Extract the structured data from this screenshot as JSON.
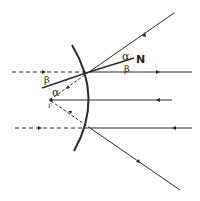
{
  "diagram": {
    "type": "convex-mirror-ray-diagram",
    "labels": {
      "alpha_upper": "α",
      "beta_upper": "β",
      "normal": "N",
      "beta_left": "β",
      "alpha_left": "α",
      "focus": "F"
    },
    "colors": {
      "line": "#2a2a2a",
      "background": "#ffffff"
    }
  }
}
